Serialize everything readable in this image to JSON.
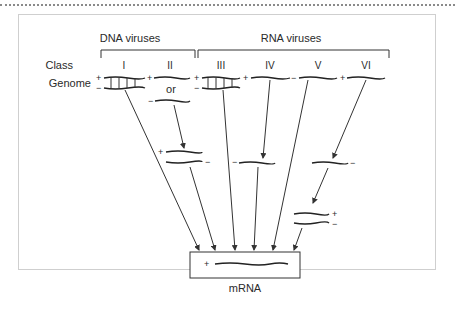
{
  "diagram": {
    "groups": [
      {
        "label": "DNA viruses",
        "classes": [
          "I",
          "II"
        ]
      },
      {
        "label": "RNA viruses",
        "classes": [
          "III",
          "IV",
          "V",
          "VI"
        ]
      }
    ],
    "row_labels": {
      "class": "Class",
      "genome": "Genome"
    },
    "classes": [
      {
        "numeral": "I",
        "genome": "double-stranded DNA",
        "signs": [
          "+",
          "−"
        ]
      },
      {
        "numeral": "II",
        "genome": "single-stranded DNA (+ or −)",
        "signs": [
          "+",
          "−"
        ],
        "connector": "or"
      },
      {
        "numeral": "III",
        "genome": "double-stranded RNA",
        "signs": [
          "+",
          "−"
        ]
      },
      {
        "numeral": "IV",
        "genome": "single-stranded RNA",
        "signs": [
          "+"
        ],
        "intermediate_sign": "−"
      },
      {
        "numeral": "V",
        "genome": "single-stranded RNA",
        "signs": [
          "−"
        ]
      },
      {
        "numeral": "VI",
        "genome": "single-stranded RNA",
        "signs": [
          "+"
        ],
        "intermediate_sign": "−",
        "second_intermediate_signs": [
          "+",
          "−"
        ]
      }
    ],
    "intermediates": {
      "class_II": {
        "signs": [
          "+",
          "−"
        ]
      },
      "class_IV": {
        "sign": "−"
      },
      "class_VI_single": {
        "sign": "−"
      },
      "class_VI_double": {
        "signs": [
          "+",
          "−"
        ]
      }
    },
    "target": {
      "label": "mRNA",
      "sign": "+"
    }
  }
}
